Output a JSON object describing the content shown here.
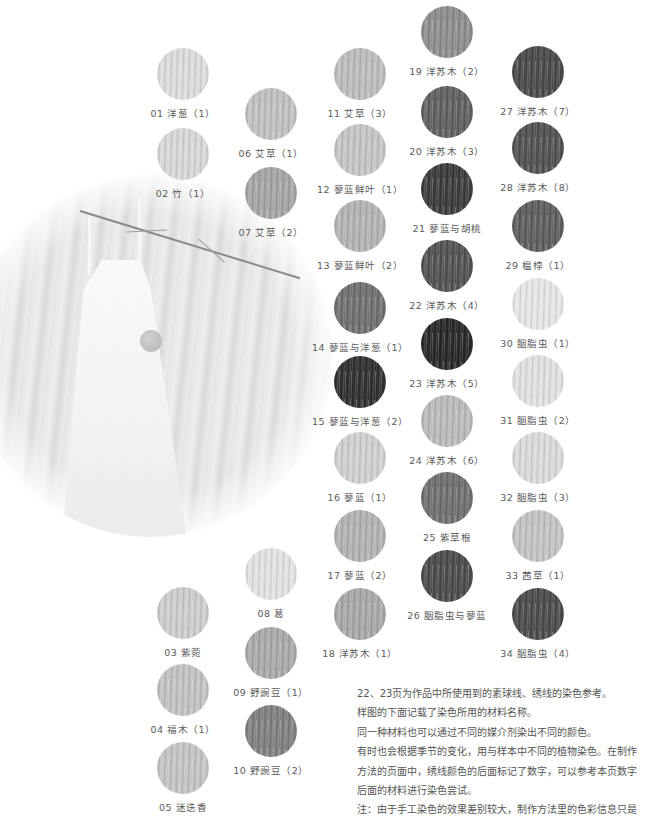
{
  "photo": {
    "subject": "white-dress-with-pompom-and-branch"
  },
  "swatches": [
    {
      "id": "01",
      "label": "01 洋葱（1）",
      "x": 157,
      "y": 48,
      "tone": "#dcdcdc"
    },
    {
      "id": "02",
      "label": "02 竹（1）",
      "x": 157,
      "y": 128,
      "tone": "#d7d7d7"
    },
    {
      "id": "03",
      "label": "03 紫菀",
      "x": 157,
      "y": 587,
      "tone": "#cdcdcd"
    },
    {
      "id": "04",
      "label": "04 福木（1）",
      "x": 157,
      "y": 664,
      "tone": "#c2c2c2"
    },
    {
      "id": "05",
      "label": "05 迷迭香",
      "x": 157,
      "y": 742,
      "tone": "#c4c4c4"
    },
    {
      "id": "06",
      "label": "06 艾草（1）",
      "x": 245,
      "y": 88,
      "tone": "#c0c0c0"
    },
    {
      "id": "07",
      "label": "07 艾草（2）",
      "x": 245,
      "y": 167,
      "tone": "#a4a4a4"
    },
    {
      "id": "08",
      "label": "08 葛",
      "x": 245,
      "y": 548,
      "tone": "#e2e2e2"
    },
    {
      "id": "09",
      "label": "09 野豌豆（1）",
      "x": 245,
      "y": 627,
      "tone": "#a9a9a9"
    },
    {
      "id": "10",
      "label": "10 野豌豆（2）",
      "x": 245,
      "y": 705,
      "tone": "#7f7f7f"
    },
    {
      "id": "11",
      "label": "11 艾草（3）",
      "x": 334,
      "y": 48,
      "tone": "#bcbcbc"
    },
    {
      "id": "12",
      "label": "12 蓼蓝鲜叶（1）",
      "x": 334,
      "y": 124,
      "tone": "#c5c5c5"
    },
    {
      "id": "13",
      "label": "13 蓼蓝鲜叶（2）",
      "x": 334,
      "y": 200,
      "tone": "#b3b3b3"
    },
    {
      "id": "14",
      "label": "14 蓼蓝与洋葱（1）",
      "x": 334,
      "y": 282,
      "tone": "#6e6e6e"
    },
    {
      "id": "15",
      "label": "15 蓼蓝与洋葱（2）",
      "x": 334,
      "y": 356,
      "tone": "#2e2e2e"
    },
    {
      "id": "16",
      "label": "16 蓼蓝（1）",
      "x": 334,
      "y": 432,
      "tone": "#d0d0d0"
    },
    {
      "id": "17",
      "label": "17 蓼蓝（2）",
      "x": 334,
      "y": 510,
      "tone": "#b2b2b2"
    },
    {
      "id": "18",
      "label": "18 洋苏木（1）",
      "x": 334,
      "y": 588,
      "tone": "#a7a7a7"
    },
    {
      "id": "19",
      "label": "19 洋苏木（2）",
      "x": 421,
      "y": 6,
      "tone": "#8c8c8c"
    },
    {
      "id": "20",
      "label": "20 洋苏木（3）",
      "x": 421,
      "y": 86,
      "tone": "#5e5e5e"
    },
    {
      "id": "21",
      "label": "21 蓼蓝与胡桃",
      "x": 421,
      "y": 163,
      "tone": "#3a3a3a"
    },
    {
      "id": "22",
      "label": "22 洋苏木（4）",
      "x": 421,
      "y": 240,
      "tone": "#505050"
    },
    {
      "id": "23",
      "label": "23 洋苏木（5）",
      "x": 421,
      "y": 318,
      "tone": "#262626"
    },
    {
      "id": "24",
      "label": "24 洋苏木（6）",
      "x": 421,
      "y": 395,
      "tone": "#bababa"
    },
    {
      "id": "25",
      "label": "25 紫草根",
      "x": 421,
      "y": 472,
      "tone": "#6e6e6e"
    },
    {
      "id": "26",
      "label": "26 胭脂虫与蓼蓝",
      "x": 421,
      "y": 550,
      "tone": "#494949"
    },
    {
      "id": "27",
      "label": "27 洋苏木（7）",
      "x": 512,
      "y": 46,
      "tone": "#484848"
    },
    {
      "id": "28",
      "label": "28 洋苏木（8）",
      "x": 512,
      "y": 122,
      "tone": "#505050"
    },
    {
      "id": "29",
      "label": "29 榅桲（1）",
      "x": 512,
      "y": 200,
      "tone": "#5c5c5c"
    },
    {
      "id": "30",
      "label": "30 胭脂虫（1）",
      "x": 512,
      "y": 278,
      "tone": "#e6e6e6"
    },
    {
      "id": "31",
      "label": "31 胭脂虫（2）",
      "x": 512,
      "y": 355,
      "tone": "#e1e1e1"
    },
    {
      "id": "32",
      "label": "32 胭脂虫（3）",
      "x": 512,
      "y": 432,
      "tone": "#dadada"
    },
    {
      "id": "33",
      "label": "33 茜草（1）",
      "x": 512,
      "y": 510,
      "tone": "#c3c3c3"
    },
    {
      "id": "34",
      "label": "34 胭脂虫（4）",
      "x": 512,
      "y": 588,
      "tone": "#4a4a4a"
    }
  ],
  "notes": [
    "22、23页为作品中所使用到的素球线、绣线的染色参考。",
    "样图的下面记载了染色所用的材料名称。",
    "同一种材料也可以通过不同的媒介剂染出不同的颜色。",
    "有时也会根据季节的变化，用与样本中不同的植物染色。在制作",
    "方法的页面中，绣线颜色的后面标记了数字，可以参考本页数字",
    "后面的材料进行染色尝试。",
    "注：由于手工染色的效果差别较大，制作方法里的色彩信息只是"
  ]
}
